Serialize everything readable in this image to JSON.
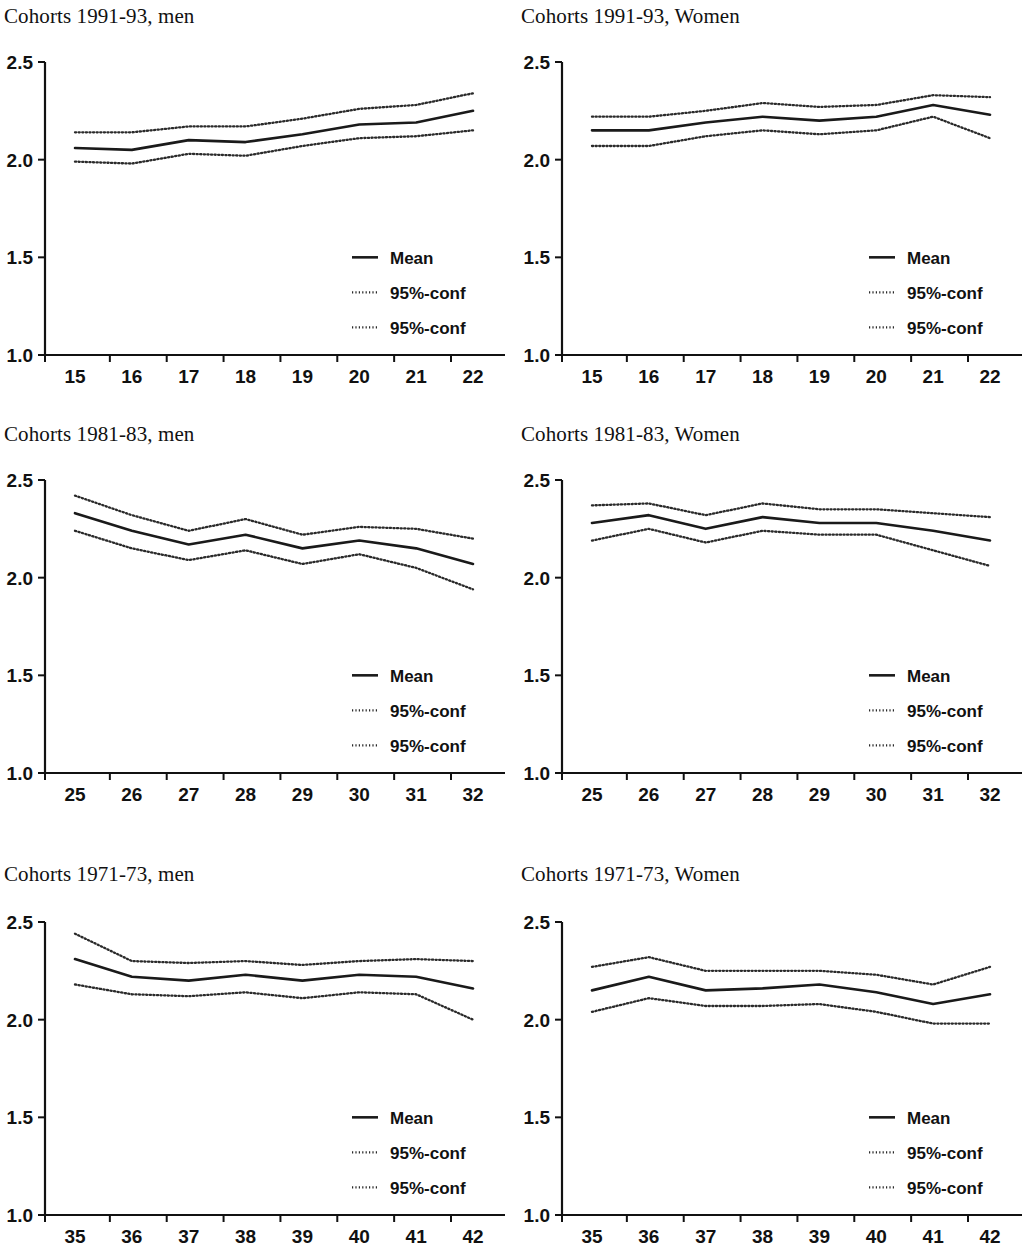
{
  "figure": {
    "panel_count": 6,
    "columns": 2,
    "rows": 3,
    "legend_entries": [
      "Mean",
      "95%-conf",
      "95%-conf"
    ],
    "y_tick_labels": [
      "2.5",
      "2.0",
      "1.5",
      "1.0"
    ],
    "colors": {
      "mean": "#1a1a1a",
      "conf": "#2a2a2a",
      "axis": "#111111",
      "background": "#ffffff"
    }
  },
  "chart_data": [
    {
      "type": "line",
      "title": "Cohorts 1991-93, men",
      "xlabel": "",
      "ylabel": "",
      "x": [
        15,
        16,
        17,
        18,
        19,
        20,
        21,
        22
      ],
      "categories": [
        "15",
        "16",
        "17",
        "18",
        "19",
        "20",
        "21",
        "22"
      ],
      "xlim": [
        14.6,
        22.4
      ],
      "ylim": [
        1.0,
        2.5
      ],
      "yticks": [
        2.5,
        2.0,
        1.5,
        1.0
      ],
      "grid": false,
      "legend_position": "lower-right",
      "series": [
        {
          "name": "Mean",
          "style": "solid",
          "values": [
            2.06,
            2.05,
            2.1,
            2.09,
            2.13,
            2.18,
            2.19,
            2.25
          ]
        },
        {
          "name": "95%-conf",
          "style": "dotted",
          "values": [
            2.14,
            2.14,
            2.17,
            2.17,
            2.21,
            2.26,
            2.28,
            2.34
          ]
        },
        {
          "name": "95%-conf",
          "style": "dotted",
          "values": [
            1.99,
            1.98,
            2.03,
            2.02,
            2.07,
            2.11,
            2.12,
            2.15
          ]
        }
      ]
    },
    {
      "type": "line",
      "title": "Cohorts 1991-93, Women",
      "xlabel": "",
      "ylabel": "",
      "x": [
        15,
        16,
        17,
        18,
        19,
        20,
        21,
        22
      ],
      "categories": [
        "15",
        "16",
        "17",
        "18",
        "19",
        "20",
        "21",
        "22"
      ],
      "xlim": [
        14.6,
        22.4
      ],
      "ylim": [
        1.0,
        2.5
      ],
      "yticks": [
        2.5,
        2.0,
        1.5,
        1.0
      ],
      "grid": false,
      "legend_position": "lower-right",
      "series": [
        {
          "name": "Mean",
          "style": "solid",
          "values": [
            2.15,
            2.15,
            2.19,
            2.22,
            2.2,
            2.22,
            2.28,
            2.23
          ]
        },
        {
          "name": "95%-conf",
          "style": "dotted",
          "values": [
            2.22,
            2.22,
            2.25,
            2.29,
            2.27,
            2.28,
            2.33,
            2.32
          ]
        },
        {
          "name": "95%-conf",
          "style": "dotted",
          "values": [
            2.07,
            2.07,
            2.12,
            2.15,
            2.13,
            2.15,
            2.22,
            2.11
          ]
        }
      ]
    },
    {
      "type": "line",
      "title": "Cohorts 1981-83, men",
      "xlabel": "",
      "ylabel": "",
      "x": [
        25,
        26,
        27,
        28,
        29,
        30,
        31,
        32
      ],
      "categories": [
        "25",
        "26",
        "27",
        "28",
        "29",
        "30",
        "31",
        "32"
      ],
      "xlim": [
        24.6,
        32.4
      ],
      "ylim": [
        1.0,
        2.5
      ],
      "yticks": [
        2.5,
        2.0,
        1.5,
        1.0
      ],
      "grid": false,
      "legend_position": "lower-right",
      "series": [
        {
          "name": "Mean",
          "style": "solid",
          "values": [
            2.33,
            2.24,
            2.17,
            2.22,
            2.15,
            2.19,
            2.15,
            2.07
          ]
        },
        {
          "name": "95%-conf",
          "style": "dotted",
          "values": [
            2.42,
            2.32,
            2.24,
            2.3,
            2.22,
            2.26,
            2.25,
            2.2
          ]
        },
        {
          "name": "95%-conf",
          "style": "dotted",
          "values": [
            2.24,
            2.15,
            2.09,
            2.14,
            2.07,
            2.12,
            2.05,
            1.94
          ]
        }
      ]
    },
    {
      "type": "line",
      "title": "Cohorts 1981-83, Women",
      "xlabel": "",
      "ylabel": "",
      "x": [
        25,
        26,
        27,
        28,
        29,
        30,
        31,
        32
      ],
      "categories": [
        "25",
        "26",
        "27",
        "28",
        "29",
        "30",
        "31",
        "32"
      ],
      "xlim": [
        24.6,
        32.4
      ],
      "ylim": [
        1.0,
        2.5
      ],
      "yticks": [
        2.5,
        2.0,
        1.5,
        1.0
      ],
      "grid": false,
      "legend_position": "lower-right",
      "series": [
        {
          "name": "Mean",
          "style": "solid",
          "values": [
            2.28,
            2.32,
            2.25,
            2.31,
            2.28,
            2.28,
            2.24,
            2.19
          ]
        },
        {
          "name": "95%-conf",
          "style": "dotted",
          "values": [
            2.37,
            2.38,
            2.32,
            2.38,
            2.35,
            2.35,
            2.33,
            2.31
          ]
        },
        {
          "name": "95%-conf",
          "style": "dotted",
          "values": [
            2.19,
            2.25,
            2.18,
            2.24,
            2.22,
            2.22,
            2.14,
            2.06
          ]
        }
      ]
    },
    {
      "type": "line",
      "title": "Cohorts 1971-73, men",
      "xlabel": "",
      "ylabel": "",
      "x": [
        35,
        36,
        37,
        38,
        39,
        40,
        41,
        42
      ],
      "categories": [
        "35",
        "36",
        "37",
        "38",
        "39",
        "40",
        "41",
        "42"
      ],
      "xlim": [
        34.6,
        42.4
      ],
      "ylim": [
        1.0,
        2.5
      ],
      "yticks": [
        2.5,
        2.0,
        1.5,
        1.0
      ],
      "grid": false,
      "legend_position": "lower-right",
      "series": [
        {
          "name": "Mean",
          "style": "solid",
          "values": [
            2.31,
            2.22,
            2.2,
            2.23,
            2.2,
            2.23,
            2.22,
            2.16
          ]
        },
        {
          "name": "95%-conf",
          "style": "dotted",
          "values": [
            2.44,
            2.3,
            2.29,
            2.3,
            2.28,
            2.3,
            2.31,
            2.3
          ]
        },
        {
          "name": "95%-conf",
          "style": "dotted",
          "values": [
            2.18,
            2.13,
            2.12,
            2.14,
            2.11,
            2.14,
            2.13,
            2.0
          ]
        }
      ]
    },
    {
      "type": "line",
      "title": "Cohorts 1971-73, Women",
      "xlabel": "",
      "ylabel": "",
      "x": [
        35,
        36,
        37,
        38,
        39,
        40,
        41,
        42
      ],
      "categories": [
        "35",
        "36",
        "37",
        "38",
        "39",
        "40",
        "41",
        "42"
      ],
      "xlim": [
        34.6,
        42.4
      ],
      "ylim": [
        1.0,
        2.5
      ],
      "yticks": [
        2.5,
        2.0,
        1.5,
        1.0
      ],
      "grid": false,
      "legend_position": "lower-right",
      "series": [
        {
          "name": "Mean",
          "style": "solid",
          "values": [
            2.15,
            2.22,
            2.15,
            2.16,
            2.18,
            2.14,
            2.08,
            2.13
          ]
        },
        {
          "name": "95%-conf",
          "style": "dotted",
          "values": [
            2.27,
            2.32,
            2.25,
            2.25,
            2.25,
            2.23,
            2.18,
            2.27
          ]
        },
        {
          "name": "95%-conf",
          "style": "dotted",
          "values": [
            2.04,
            2.11,
            2.07,
            2.07,
            2.08,
            2.04,
            1.98,
            1.98
          ]
        }
      ]
    }
  ]
}
